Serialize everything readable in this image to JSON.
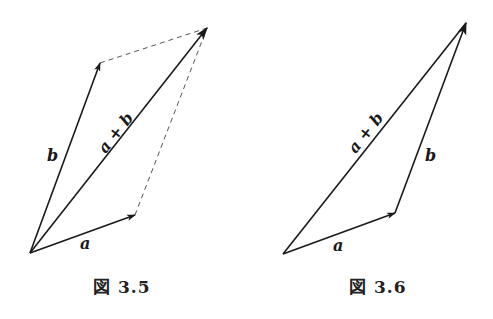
{
  "figures": [
    {
      "caption": "図 3.5",
      "labels": {
        "a": "a",
        "b": "b",
        "sum": "a + b"
      },
      "style": "parallelogram",
      "points": {
        "origin": [
          30,
          253
        ],
        "a_tip": [
          135,
          215
        ],
        "b_tip": [
          100,
          63
        ],
        "sum_tip": [
          207,
          28
        ]
      }
    },
    {
      "caption": "図 3.6",
      "labels": {
        "a": "a",
        "b": "b",
        "sum": "a + b"
      },
      "style": "triangle",
      "points": {
        "origin": [
          283,
          254
        ],
        "a_tip": [
          395,
          213
        ],
        "sum_tip": [
          466,
          23
        ]
      }
    }
  ],
  "colors": {
    "line": "#1a1a1a",
    "dashed": "#555555",
    "background": "#ffffff"
  }
}
